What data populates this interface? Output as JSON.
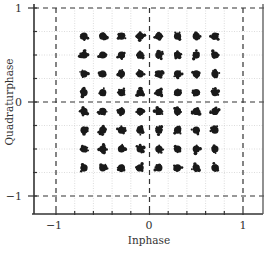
{
  "chart_data": {
    "type": "scatter",
    "title": "",
    "subtitle": "64-QAM constellation diagram",
    "xlabel": "Inphase",
    "ylabel": "Quadraturphase",
    "xlim": [
      -1.12,
      1.22
    ],
    "ylim": [
      -1.19,
      1.0
    ],
    "x_ticks": [
      -1,
      -0.8,
      -0.6,
      -0.4,
      -0.2,
      0,
      0.2,
      0.4,
      0.6,
      0.8,
      1
    ],
    "x_tick_labels": [
      {
        "value": -1,
        "label": "−1"
      },
      {
        "value": 0,
        "label": "0"
      },
      {
        "value": 1,
        "label": "1"
      }
    ],
    "y_ticks": [
      -1,
      -0.75,
      -0.5,
      -0.25,
      0,
      0.25,
      0.5,
      0.75,
      1
    ],
    "y_tick_labels": [
      {
        "value": 1,
        "label": "1"
      },
      {
        "value": 0,
        "label": "0"
      },
      {
        "value": -1,
        "label": "−1"
      }
    ],
    "grid": true,
    "grid_style": "dotted light",
    "reference_lines": {
      "dashed_vertical": [
        -1,
        0,
        1
      ],
      "dashed_horizontal": [
        -1,
        0,
        1
      ]
    },
    "legend": null,
    "levels_inphase": [
      -0.7,
      -0.5,
      -0.3,
      -0.1,
      0.1,
      0.3,
      0.5,
      0.7
    ],
    "levels_quadrature": [
      0.7,
      0.5,
      0.3,
      0.1,
      -0.1,
      -0.3,
      -0.5,
      -0.7
    ],
    "points_description": "8x8 grid of noisy symbol clusters (64 clusters) at every combination of inphase and quadrature levels",
    "marker_color": "#1a1a1a"
  },
  "labels": {
    "xlabel": "Inphase",
    "ylabel": "Quadraturphase",
    "x_minus1": "−1",
    "x_zero": "0",
    "x_one": "1",
    "y_one": "1",
    "y_zero": "0",
    "y_minus1": "−1"
  }
}
